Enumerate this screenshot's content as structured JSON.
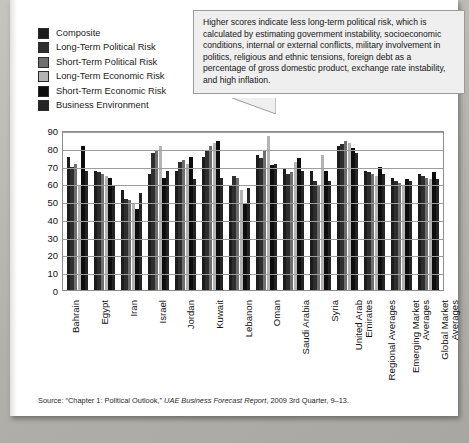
{
  "callout": {
    "text": "Higher scores indicate less long-term political risk, which is calculated by estimating government instability, socioeconomic conditions, internal or external conflicts, military involvement in politics, religious and ethnic tensions, foreign debt as a percentage of gross domestic product, exchange rate instability, and high inflation."
  },
  "source": {
    "prefix": "Source: “Chapter 1: Political Outlook,” ",
    "italic": "UAE Business Forecast Report",
    "suffix": ", 2009 3rd Quarter, 9–13."
  },
  "chart_data": {
    "type": "bar",
    "title": "",
    "xlabel": "",
    "ylabel": "",
    "ylim": [
      0,
      90
    ],
    "yticks": [
      0,
      10,
      20,
      30,
      40,
      50,
      60,
      70,
      80,
      90
    ],
    "grid": true,
    "legend_position": "top-left",
    "categories": [
      "Bahrain",
      "Egypt",
      "Iran",
      "Israel",
      "Jordan",
      "Kuwait",
      "Lebanon",
      "Oman",
      "Saudi Arabia",
      "Syria",
      "United Arab Emirates",
      "Regional Averages",
      "Emerging Market Averages",
      "Global Market Averages"
    ],
    "series": [
      {
        "name": "Composite",
        "color": "#1c1c1c",
        "values": [
          76,
          68,
          57,
          66,
          68,
          76,
          60,
          77,
          69,
          68,
          82,
          68,
          64,
          66
        ]
      },
      {
        "name": "Long-Term Political Risk",
        "color": "#2e2e2e",
        "values": [
          70,
          67,
          52,
          78,
          73,
          80,
          65,
          75,
          66,
          62,
          83,
          67,
          62,
          65
        ]
      },
      {
        "name": "Short-Term Political Risk",
        "color": "#6f6f6f",
        "values": [
          72,
          66,
          51,
          80,
          74,
          82,
          64,
          79,
          67,
          60,
          85,
          66,
          61,
          64
        ]
      },
      {
        "name": "Long-Term Economic Risk",
        "color": "#b4b4b4",
        "values": [
          59,
          65,
          49,
          82,
          72,
          84,
          57,
          88,
          73,
          77,
          84,
          65,
          60,
          63
        ]
      },
      {
        "name": "Short-Term Economic Risk",
        "color": "#0d0d0d",
        "values": [
          82,
          64,
          46,
          64,
          76,
          85,
          49,
          71,
          75,
          68,
          81,
          70,
          63,
          67
        ]
      },
      {
        "name": "Business Environment",
        "color": "#242424",
        "values": [
          68,
          60,
          55,
          68,
          63,
          64,
          58,
          72,
          68,
          62,
          78,
          66,
          62,
          63
        ]
      }
    ]
  }
}
